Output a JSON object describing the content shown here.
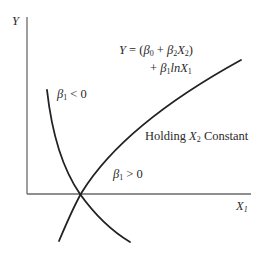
{
  "diagram": {
    "type": "function-plot",
    "axes": {
      "y_label": "Y",
      "x_label": "X",
      "x_label_sub": "1"
    },
    "equation": {
      "line1": {
        "lhs": "Y",
        "eq": "=",
        "open": "(",
        "b0": "β",
        "b0_sub": "0",
        "plus1": "+",
        "b2": "β",
        "b2_sub": "2",
        "x2": "X",
        "x2_sub": "2",
        "close": ")"
      },
      "line2": {
        "plus": "+",
        "b1": "β",
        "b1_sub": "1",
        "ln": "ln",
        "x1": "X",
        "x1_sub": "1"
      }
    },
    "annotations": {
      "holding": {
        "prefix": "Holding",
        "var": "X",
        "var_sub": "2",
        "suffix": "Constant"
      },
      "negative_case": {
        "beta": "β",
        "beta_sub": "1",
        "relation": "< 0"
      },
      "positive_case": {
        "beta": "β",
        "beta_sub": "1",
        "relation": "> 0"
      }
    },
    "curves": [
      {
        "name": "beta1-positive",
        "shape": "increasing-concave-log"
      },
      {
        "name": "beta1-negative",
        "shape": "decreasing-convex-log"
      }
    ],
    "colors": {
      "axis": "#6a6a6a",
      "curve": "#222222",
      "text": "#2a2a2a"
    }
  }
}
